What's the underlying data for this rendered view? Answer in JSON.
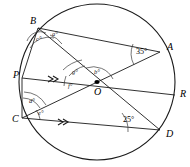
{
  "figure": {
    "kind": "circle-geometry-diagram",
    "center_label": "O",
    "points": [
      {
        "id": "B",
        "label": "B",
        "x": 38,
        "y": 28,
        "lx": 30,
        "ly": 24
      },
      {
        "id": "A",
        "label": "A",
        "x": 160,
        "y": 52,
        "lx": 167,
        "ly": 50
      },
      {
        "id": "P",
        "label": "P",
        "x": 22,
        "y": 78,
        "lx": 13,
        "ly": 78
      },
      {
        "id": "O",
        "label": "O",
        "x": 97,
        "y": 82,
        "lx": 94,
        "ly": 95
      },
      {
        "id": "R",
        "label": "R",
        "x": 175,
        "y": 95,
        "lx": 180,
        "ly": 97
      },
      {
        "id": "C",
        "label": "C",
        "x": 22,
        "y": 118,
        "lx": 12,
        "ly": 122
      },
      {
        "id": "D",
        "label": "D",
        "x": 160,
        "y": 130,
        "lx": 166,
        "ly": 137
      }
    ],
    "circle": {
      "cx": 97,
      "cy": 82,
      "r": 78
    },
    "segments": [
      {
        "name": "chord-B-A",
        "from": "B",
        "to": "A"
      },
      {
        "name": "chord-B-D",
        "from": "B",
        "to": "D"
      },
      {
        "name": "chord-C-A",
        "from": "C",
        "to": "A"
      },
      {
        "name": "line-P-R",
        "from": "P",
        "to": "R"
      },
      {
        "name": "chord-C-D",
        "from": "C",
        "to": "D"
      },
      {
        "name": "chord-B-C",
        "from": "B",
        "to": "C"
      },
      {
        "name": "chord-B-P",
        "from": "B",
        "to": "P"
      }
    ],
    "angles": [
      {
        "name": "angle-a",
        "label": "a°",
        "lx": 52,
        "ly": 36,
        "vertex": "B"
      },
      {
        "name": "angle-c",
        "label": "c°",
        "lx": 36,
        "ly": 41,
        "vertex": "B"
      },
      {
        "name": "angle-b",
        "label": "b°",
        "lx": 94,
        "ly": 74,
        "vertex": "O"
      },
      {
        "name": "angle-g",
        "label": "g°",
        "lx": 72,
        "ly": 74,
        "vertex": "O"
      },
      {
        "name": "angle-f",
        "label": "f°",
        "lx": 68,
        "ly": 88,
        "vertex": "O"
      },
      {
        "name": "angle-d",
        "label": "d°",
        "lx": 29,
        "ly": 103,
        "vertex": "C"
      },
      {
        "name": "angle-e",
        "label": "e°",
        "lx": 38,
        "ly": 115,
        "vertex": "C"
      },
      {
        "name": "angle-35",
        "label": "35°",
        "lx": 136,
        "ly": 54,
        "vertex": "A"
      },
      {
        "name": "angle-25",
        "label": "25°",
        "lx": 123,
        "ly": 122,
        "vertex": "D"
      }
    ],
    "parallel_marks": [
      {
        "name": "parallel-mark-PR",
        "x": 52,
        "y": 79
      },
      {
        "name": "parallel-mark-CD",
        "x": 62,
        "y": 122
      }
    ]
  }
}
